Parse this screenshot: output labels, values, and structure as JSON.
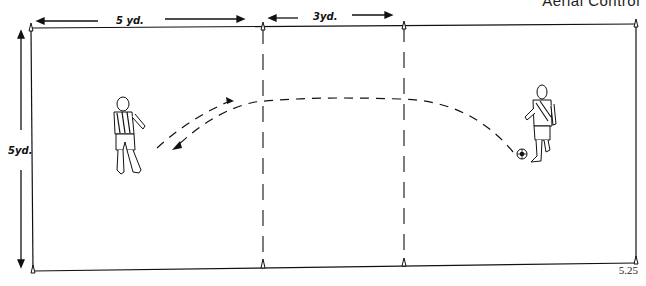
{
  "header": {
    "title": "Aerial Control"
  },
  "figure": {
    "number": "5.25"
  },
  "labels": {
    "width_left": "5 yd.",
    "width_middle": "3yd.",
    "height": "5yd."
  },
  "colors": {
    "line": "#111111",
    "background": "#ffffff"
  },
  "field": {
    "outline": "rectangle",
    "cones": [
      "top-left",
      "top-mid-left",
      "top-mid-right",
      "top-right",
      "bottom-left",
      "bottom-mid-left",
      "bottom-mid-right",
      "bottom-right"
    ],
    "neutral_zone_lines": "dashed"
  },
  "players": [
    {
      "id": "player-left",
      "jersey": "striped",
      "facing": "right"
    },
    {
      "id": "player-right",
      "jersey": "sash",
      "has_ball": true
    }
  ],
  "paths": [
    {
      "id": "lofted-pass",
      "from": "player-right",
      "to": "player-left",
      "style": "dashed"
    },
    {
      "id": "return-pass",
      "from": "player-left",
      "to": "center",
      "style": "dashed"
    }
  ]
}
